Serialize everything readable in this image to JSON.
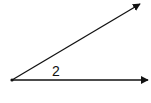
{
  "diagram": {
    "type": "angle",
    "angle_label": "2",
    "vertex": {
      "x": 12,
      "y": 80
    },
    "rays": [
      {
        "name": "upper-ray",
        "from": [
          12,
          80
        ],
        "to": [
          140,
          4
        ]
      },
      {
        "name": "horizontal-ray",
        "from": [
          12,
          80
        ],
        "to": [
          148,
          80
        ]
      }
    ],
    "colors": {
      "stroke": "#111111",
      "background": "#ffffff"
    }
  }
}
